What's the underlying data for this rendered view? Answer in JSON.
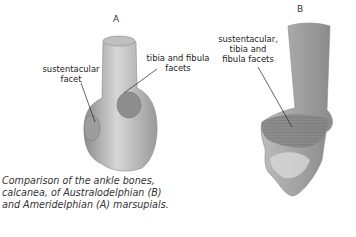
{
  "figure": {
    "panel_a": {
      "letter": "A",
      "labels": [
        {
          "id": "sustentacular-facet",
          "lines": [
            "sustentacular",
            "facet"
          ]
        },
        {
          "id": "tibia-fibula-facets",
          "lines": [
            "tibia and fibula",
            "facets"
          ]
        }
      ]
    },
    "panel_b": {
      "letter": "B",
      "labels": [
        {
          "id": "combined-facets",
          "lines": [
            "sustentacular,",
            "tibia and",
            "fibula facets"
          ]
        }
      ]
    },
    "caption": "Comparison of the ankle bones, calcanea, of Australodelphian (B) and Ameridelphian (A) marsupials.",
    "colors": {
      "bone_light": "#d9d9d9",
      "bone_mid": "#a8a8a8",
      "bone_dark": "#7a7a7a",
      "text": "#222222"
    }
  }
}
